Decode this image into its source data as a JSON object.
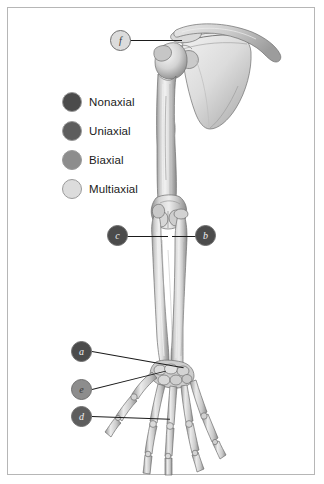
{
  "figure": {
    "background_color": "#ffffff",
    "border_color": "#b6b6b6"
  },
  "legend": {
    "items": [
      {
        "label": "Nonaxial",
        "color": "#4b4b4b"
      },
      {
        "label": "Uniaxial",
        "color": "#5d5d5d"
      },
      {
        "label": "Biaxial",
        "color": "#8d8d8d"
      },
      {
        "label": "Multiaxial",
        "color": "#dcdcdc"
      }
    ]
  },
  "markers": [
    {
      "id": "f",
      "label": "f",
      "color": "#dcdcdc",
      "tone": "light",
      "target": "shoulder-joint"
    },
    {
      "id": "c",
      "label": "c",
      "color": "#4b4b4b",
      "tone": "dark",
      "target": "elbow-joint-left"
    },
    {
      "id": "b",
      "label": "b",
      "color": "#4b4b4b",
      "tone": "dark",
      "target": "elbow-joint-right"
    },
    {
      "id": "a",
      "label": "a",
      "color": "#4b4b4b",
      "tone": "dark",
      "target": "wrist-joint"
    },
    {
      "id": "e",
      "label": "e",
      "color": "#8d8d8d",
      "tone": "light",
      "target": "thumb-carpometacarpal-joint"
    },
    {
      "id": "d",
      "label": "d",
      "color": "#5d5d5d",
      "tone": "dark",
      "target": "metacarpophalangeal-joint"
    }
  ],
  "anatomy": {
    "regions": [
      "clavicle",
      "scapula",
      "humerus",
      "radius",
      "ulna",
      "carpals",
      "metacarpals",
      "phalanges"
    ]
  }
}
